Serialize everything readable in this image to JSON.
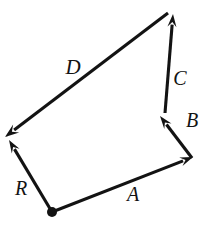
{
  "figure": {
    "kind": "vector-addition-diagram",
    "background_color": "#ffffff",
    "stroke_color": "#131313",
    "width": 213,
    "height": 226,
    "origin_label": ""
  },
  "vectors": [
    {
      "id": "A",
      "label": "A",
      "label_x": 133,
      "label_y": 194,
      "label_size": 20,
      "tail_x": 52,
      "tail_y": 212,
      "tip_x": 193,
      "tip_y": 157,
      "head_size": 13,
      "head_width": 9
    },
    {
      "id": "B",
      "label": "B",
      "label_x": 192,
      "label_y": 120,
      "label_size": 20,
      "tail_x": 192,
      "tail_y": 158,
      "tip_x": 160,
      "tip_y": 116,
      "head_size": 13,
      "head_width": 9
    },
    {
      "id": "C",
      "label": "C",
      "label_x": 180,
      "label_y": 78,
      "label_size": 20,
      "tail_x": 165,
      "tail_y": 113,
      "tip_x": 173,
      "tip_y": 14,
      "head_size": 13,
      "head_width": 9
    },
    {
      "id": "D",
      "label": "D",
      "label_x": 73,
      "label_y": 67,
      "label_size": 21,
      "tail_x": 168,
      "tail_y": 13,
      "tip_x": 5,
      "tip_y": 137,
      "head_size": 14,
      "head_width": 10
    },
    {
      "id": "R",
      "label": "R",
      "label_x": 21,
      "label_y": 188,
      "label_size": 20,
      "tail_x": 52,
      "tail_y": 212,
      "tip_x": 9,
      "tip_y": 140,
      "head_size": 13,
      "head_width": 9
    }
  ],
  "origin_point": {
    "name": "origin-dot",
    "x": 52,
    "y": 212,
    "radius": 5
  }
}
